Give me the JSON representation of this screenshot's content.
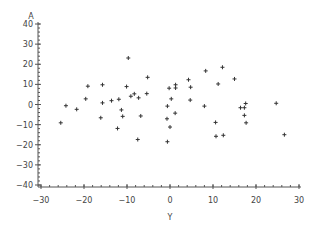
{
  "chart_data": {
    "type": "scatter",
    "title": "",
    "xlabel": "Y",
    "ylabel": "A",
    "xlim": [
      -30,
      30
    ],
    "ylim": [
      -40,
      40
    ],
    "xticks": [
      -30,
      -20,
      -10,
      0,
      10,
      20,
      30
    ],
    "yticks": [
      40,
      30,
      20,
      10,
      0,
      -10,
      -20,
      -30,
      -40
    ],
    "xtick_labels": [
      "−30",
      "−20",
      "−10",
      "0",
      "10",
      "20",
      "30"
    ],
    "ytick_labels": [
      "40",
      "30",
      "20",
      "10",
      "0",
      "−10",
      "−20",
      "−30",
      "−40"
    ],
    "x_minor_step": 2,
    "y_minor_step": 2,
    "marker": "plus",
    "grid": false,
    "legend": "none",
    "series": [
      {
        "name": "A vs Y",
        "color": "#333333",
        "points": [
          [
            -25.4,
            -9.1
          ],
          [
            -24.2,
            -0.6
          ],
          [
            -21.7,
            -2.4
          ],
          [
            -19.6,
            2.8
          ],
          [
            -19.1,
            9.1
          ],
          [
            -15.7,
            9.8
          ],
          [
            -15.7,
            0.8
          ],
          [
            -16.1,
            -6.6
          ],
          [
            -13.6,
            1.9
          ],
          [
            -11.9,
            2.6
          ],
          [
            -11.3,
            -2.7
          ],
          [
            -11.0,
            -5.9
          ],
          [
            -12.2,
            -11.9
          ],
          [
            -9.7,
            23.1
          ],
          [
            -10.1,
            8.9
          ],
          [
            -9.1,
            4.1
          ],
          [
            -8.3,
            5.3
          ],
          [
            -7.3,
            3.3
          ],
          [
            -5.4,
            5.4
          ],
          [
            -5.2,
            13.5
          ],
          [
            -6.8,
            -5.7
          ],
          [
            -7.5,
            -17.4
          ],
          [
            -0.2,
            8.1
          ],
          [
            1.3,
            9.8
          ],
          [
            1.3,
            8.2
          ],
          [
            0.3,
            2.8
          ],
          [
            -0.6,
            -0.8
          ],
          [
            1.2,
            -4.3
          ],
          [
            -0.7,
            -7.1
          ],
          [
            0.0,
            -11.2
          ],
          [
            -0.6,
            -18.5
          ],
          [
            4.3,
            12.3
          ],
          [
            4.8,
            8.6
          ],
          [
            4.7,
            2.2
          ],
          [
            8.3,
            16.7
          ],
          [
            8.0,
            -0.8
          ],
          [
            12.2,
            18.5
          ],
          [
            15.0,
            12.7
          ],
          [
            11.2,
            10.2
          ],
          [
            10.6,
            -8.9
          ],
          [
            10.7,
            -15.8
          ],
          [
            12.4,
            -15.3
          ],
          [
            16.4,
            -1.6
          ],
          [
            17.3,
            -1.6
          ],
          [
            17.6,
            0.5
          ],
          [
            17.3,
            -5.4
          ],
          [
            17.7,
            -9.1
          ],
          [
            24.7,
            0.6
          ],
          [
            26.6,
            -15.0
          ]
        ]
      }
    ]
  }
}
